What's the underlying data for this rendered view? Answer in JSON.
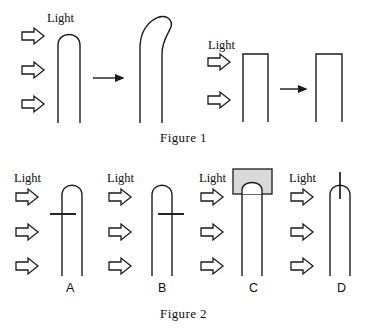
{
  "figure": {
    "title_hidden": "",
    "captions": [
      {
        "id": "fig1",
        "text": "Figure 1"
      },
      {
        "id": "fig2",
        "text": "Figure 2"
      }
    ],
    "colors": {
      "stroke": "#1a1a1a",
      "background": "#ffffff",
      "cap_fill": "#d9d9d9",
      "cap_stroke": "#1a1a1a",
      "arrow_stroke": "#1a1a1a",
      "arrow_fill": "#ffffff",
      "text": "#0d0d0d"
    },
    "light_labels": [
      {
        "id": "light-fig1-left",
        "text": "Light"
      },
      {
        "id": "light-fig1-right",
        "text": "Light"
      },
      {
        "id": "light-fig2-a",
        "text": "Light"
      },
      {
        "id": "light-fig2-b",
        "text": "Light"
      },
      {
        "id": "light-fig2-c",
        "text": "Light"
      },
      {
        "id": "light-fig2-d",
        "text": "Light"
      }
    ],
    "figure1": {
      "caption": "Figure 1",
      "light_label_left": "Light",
      "light_label_right": "Light",
      "experiments": [
        {
          "id": "exp1",
          "light_label": "Light",
          "light_arrow_count": 3,
          "before": {
            "specimen": "intact-coleoptile",
            "tip": "rounded",
            "orientation": "upright"
          },
          "result_arrow": "rightwards-arrow",
          "after": {
            "specimen": "intact-coleoptile",
            "tip": "rounded",
            "orientation": "bent-toward-light"
          }
        },
        {
          "id": "exp2",
          "light_label": "Light",
          "light_arrow_count": 2,
          "before": {
            "specimen": "decapitated-coleoptile",
            "tip": "flat-cut",
            "orientation": "upright"
          },
          "result_arrow": "rightwards-arrow",
          "after": {
            "specimen": "decapitated-coleoptile",
            "tip": "flat-cut",
            "orientation": "upright-no-bending"
          }
        }
      ]
    },
    "figure2": {
      "caption": "Figure 2",
      "panels": [
        {
          "id": "panel-a",
          "label": "A",
          "light_label": "Light",
          "light_arrow_count": 3,
          "treatment": "horizontal-barrier-inserted-on-light-side",
          "barrier_orientation": "horizontal",
          "barrier_side": "left"
        },
        {
          "id": "panel-b",
          "label": "B",
          "light_label": "Light",
          "light_arrow_count": 3,
          "treatment": "horizontal-barrier-inserted-on-shaded-side",
          "barrier_orientation": "horizontal",
          "barrier_side": "right"
        },
        {
          "id": "panel-c",
          "label": "C",
          "light_label": "Light",
          "light_arrow_count": 3,
          "treatment": "opaque-cap-over-tip",
          "cap": "opaque-gray-cap"
        },
        {
          "id": "panel-d",
          "label": "D",
          "light_label": "Light",
          "light_arrow_count": 3,
          "treatment": "vertical-barrier-through-tip",
          "barrier_orientation": "vertical",
          "barrier_side": "center"
        }
      ]
    }
  }
}
